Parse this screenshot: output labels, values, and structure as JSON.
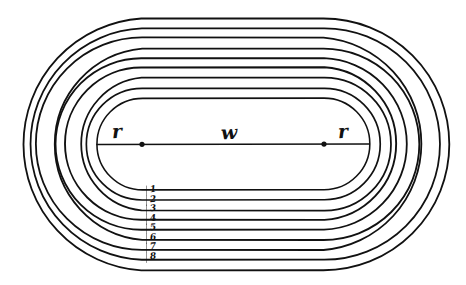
{
  "figure": {
    "kind": "hand-drawn geometry diagram",
    "background_color": "#ffffff",
    "ink_color": "#111111"
  },
  "labels": {
    "radius_left": "r",
    "radius_right": "r",
    "width_center": "w"
  },
  "lanes": {
    "count": 8,
    "numbers": [
      "1",
      "2",
      "3",
      "4",
      "5",
      "6",
      "7",
      "8"
    ]
  },
  "chart_data": {
    "type": "diagram",
    "geometry": {
      "center_line_y": 144,
      "left_center_x": 142,
      "right_center_x": 324,
      "straight_length_px": 182,
      "inner_radius_px": 46,
      "lane_width_px": 10,
      "boundary_count": 9,
      "inner_oval_left_x": 96,
      "inner_oval_right_x": 370,
      "inner_oval_top_y": 98,
      "inner_oval_bottom_y": 190,
      "outer_oval_left_x": 16,
      "outer_oval_right_x": 450,
      "outer_oval_top_y": 18,
      "outer_oval_bottom_y": 270
    },
    "annotations": [
      {
        "text": "r",
        "x": 118,
        "y": 132,
        "meaning": "radius of inner semicircle (left)"
      },
      {
        "text": "w",
        "x": 228,
        "y": 130,
        "meaning": "length of the straightaway"
      },
      {
        "text": "r",
        "x": 344,
        "y": 132,
        "meaning": "radius of inner semicircle (right)"
      },
      {
        "text": "1",
        "x": 150,
        "y": 194,
        "meaning": "lane 1"
      },
      {
        "text": "2",
        "x": 150,
        "y": 204,
        "meaning": "lane 2"
      },
      {
        "text": "3",
        "x": 150,
        "y": 213,
        "meaning": "lane 3"
      },
      {
        "text": "4",
        "x": 150,
        "y": 223,
        "meaning": "lane 4"
      },
      {
        "text": "5",
        "x": 150,
        "y": 232,
        "meaning": "lane 5"
      },
      {
        "text": "6",
        "x": 150,
        "y": 242,
        "meaning": "lane 6"
      },
      {
        "text": "7",
        "x": 150,
        "y": 251,
        "meaning": "lane 7"
      },
      {
        "text": "8",
        "x": 150,
        "y": 261,
        "meaning": "lane 8"
      }
    ],
    "markers": [
      {
        "name": "left-center-dot",
        "x": 142,
        "y": 144
      },
      {
        "name": "right-center-dot",
        "x": 324,
        "y": 144
      }
    ],
    "grid": false,
    "legend": null
  }
}
